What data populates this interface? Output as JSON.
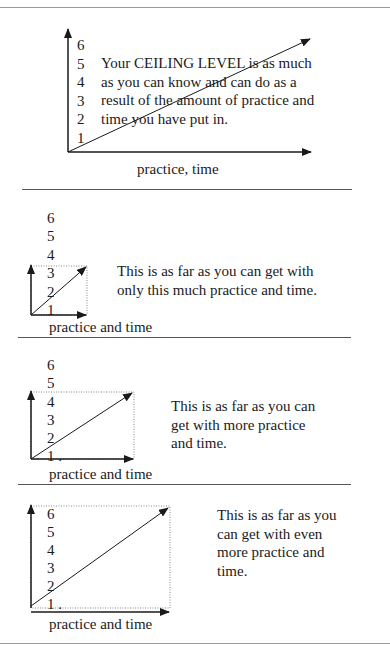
{
  "page": {
    "header_fragment": "g"
  },
  "diagrams": [
    {
      "id": "ceiling-level",
      "y_ticks": [
        "6",
        "5",
        "4",
        "3",
        "2",
        "1"
      ],
      "text_lines": [
        "Your CEILING LEVEL is as much",
        "as you can know and can do as a",
        "result of the amount of practice and",
        "time you have put in."
      ],
      "x_label": "practice, time"
    },
    {
      "id": "limit-low",
      "y_ticks": [
        "6",
        "5",
        "4",
        "3",
        "2",
        "1"
      ],
      "text_lines": [
        "This is as far as you can get with",
        "only this much practice and time."
      ],
      "x_label": "practice and time"
    },
    {
      "id": "limit-medium",
      "y_ticks": [
        "6",
        "5",
        "4",
        "3",
        "2",
        "1 ."
      ],
      "text_lines": [
        "This is as far as you can",
        "get with more practice",
        "and time."
      ],
      "x_label": "practice and time"
    },
    {
      "id": "limit-high",
      "y_ticks": [
        "6",
        "5",
        "4",
        "3",
        "2",
        "1 ."
      ],
      "text_lines": [
        "This is as far as you",
        "can get with even",
        "more practice and",
        "time."
      ],
      "x_label": "practice and time"
    }
  ],
  "colors": {
    "ink": "#1a1a1a",
    "rule": "#555555",
    "dotted_box": "#888888"
  }
}
